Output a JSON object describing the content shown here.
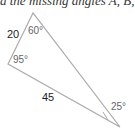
{
  "caption": "d the missing angles A, B, C",
  "triangle": {
    "vertices": {
      "top": [
        33,
        13
      ],
      "left": [
        8,
        64
      ],
      "bottom_right": [
        120,
        127
      ]
    },
    "sides": [
      {
        "id": "top-left",
        "label": "20"
      },
      {
        "id": "left-bottom",
        "label": "45"
      }
    ],
    "angles": [
      {
        "vertex": "top",
        "label": "60°"
      },
      {
        "vertex": "left",
        "label": "95°"
      },
      {
        "vertex": "bottom_right",
        "label": "25°"
      }
    ],
    "stroke_color": "#aaaaaa"
  }
}
